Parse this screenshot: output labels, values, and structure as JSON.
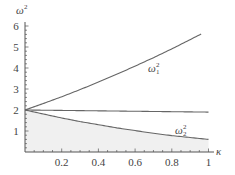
{
  "chart_data": {
    "type": "line",
    "title": "",
    "xlabel": "κ",
    "ylabel": "ω²",
    "xlim": [
      0,
      1
    ],
    "ylim": [
      0,
      6
    ],
    "x_ticks": [
      "0.2",
      "0.4",
      "0.6",
      "0.8",
      "1"
    ],
    "y_ticks": [
      "1",
      "2",
      "3",
      "4",
      "5",
      "6"
    ],
    "grid": false,
    "legend": "none (inline curve labels)",
    "x": [
      0,
      0.1,
      0.2,
      0.3,
      0.4,
      0.5,
      0.6,
      0.7,
      0.8,
      0.9,
      1.0
    ],
    "series": [
      {
        "name": "ω₁²",
        "label_main": "ω",
        "label_sub": "1",
        "label_sup": "2",
        "values": [
          2.0,
          2.31,
          2.63,
          2.97,
          3.33,
          3.7,
          4.09,
          4.49,
          4.91,
          5.35,
          5.8
        ]
      },
      {
        "name": "horizontal",
        "label_main": "",
        "label_sub": "",
        "label_sup": "",
        "values": [
          2.0,
          1.99,
          1.98,
          1.97,
          1.96,
          1.95,
          1.94,
          1.93,
          1.92,
          1.91,
          1.9
        ]
      },
      {
        "name": "ω₂²",
        "label_main": "ω",
        "label_sub": "2",
        "label_sup": "2",
        "values": [
          2.0,
          1.81,
          1.62,
          1.45,
          1.3,
          1.15,
          1.02,
          0.89,
          0.78,
          0.69,
          0.6
        ]
      }
    ],
    "annotations": [
      "shaded region below ω₂² curve"
    ]
  },
  "axis": {
    "ylabel_main": "ω",
    "ylabel_sup": "2",
    "xlabel": "κ"
  }
}
